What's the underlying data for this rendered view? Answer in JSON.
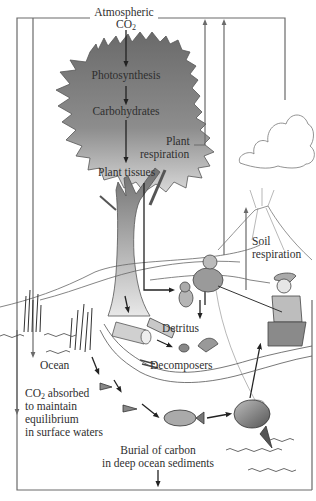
{
  "diagram": {
    "labels": {
      "atmospheric": "Atmospheric",
      "co2_main": "CO",
      "co2_sub": "2",
      "photosynthesis": "Photosynthesis",
      "carbohydrates": "Carbohydrates",
      "plant_respiration_1": "Plant",
      "plant_respiration_2": "respiration",
      "plant_tissues": "Plant tissues",
      "soil_respiration_1": "Soil",
      "soil_respiration_2": "respiration",
      "detritus": "Detritus",
      "decomposers": "Decomposers",
      "ocean": "Ocean",
      "co2_absorbed_main": "CO",
      "co2_absorbed_sub": "2",
      "co2_absorbed_rest": " absorbed",
      "absorbed_line2": "to maintain",
      "absorbed_line3": "equilibrium",
      "absorbed_line4": "in surface waters",
      "burial_1": "Burial of carbon",
      "burial_2": "in deep ocean sediments"
    },
    "flows": [
      {
        "from": "Atmospheric CO2",
        "to": "Photosynthesis"
      },
      {
        "from": "Photosynthesis",
        "to": "Carbohydrates"
      },
      {
        "from": "Carbohydrates",
        "to": "Plant tissues"
      },
      {
        "from": "Plant respiration",
        "to": "Atmospheric CO2"
      },
      {
        "from": "Plant tissues",
        "to": "Animals"
      },
      {
        "from": "Animals",
        "to": "Detritus"
      },
      {
        "from": "Soil respiration",
        "to": "Atmospheric CO2"
      },
      {
        "from": "Volcano",
        "to": "Atmospheric CO2"
      },
      {
        "from": "Atmospheric CO2",
        "to": "Ocean"
      },
      {
        "from": "Fish",
        "to": "Human"
      },
      {
        "from": "Ocean",
        "to": "Burial in deep ocean sediments"
      }
    ],
    "colors": {
      "line": "#6a6a6a",
      "tree_dark": "#6f6f6f",
      "tree_light": "#d4d4d4",
      "text": "#2f2f2f"
    }
  }
}
